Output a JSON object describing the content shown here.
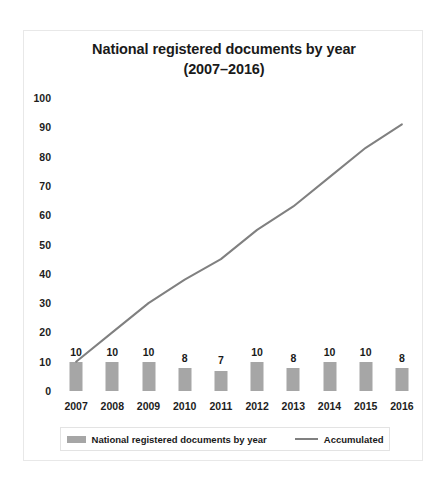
{
  "chart_data": {
    "type": "bar",
    "title": "National registered documents by year",
    "subtitle": "(2007–2016)",
    "xlabel": "",
    "ylabel": "",
    "ylim": [
      0,
      100
    ],
    "yticks": [
      0,
      10,
      20,
      30,
      40,
      50,
      60,
      70,
      80,
      90,
      100
    ],
    "grid": false,
    "legend_position": "bottom",
    "categories": [
      "2007",
      "2008",
      "2009",
      "2010",
      "2011",
      "2012",
      "2013",
      "2014",
      "2015",
      "2016"
    ],
    "series": [
      {
        "name": "National registered documents by year",
        "type": "bar",
        "color": "#a6a6a6",
        "values": [
          10,
          10,
          10,
          8,
          7,
          10,
          8,
          10,
          10,
          8
        ],
        "labels": [
          "10",
          "10",
          "10",
          "8",
          "7",
          "10",
          "8",
          "10",
          "10",
          "8"
        ]
      },
      {
        "name": "Accumulated",
        "type": "line",
        "color": "#808080",
        "values": [
          10,
          20,
          30,
          38,
          45,
          55,
          63,
          73,
          83,
          91
        ]
      }
    ]
  },
  "legend": {
    "entries": [
      {
        "label": "National registered documents by year",
        "marker": "bar-swatch"
      },
      {
        "label": "Accumulated",
        "marker": "line-swatch"
      }
    ]
  }
}
